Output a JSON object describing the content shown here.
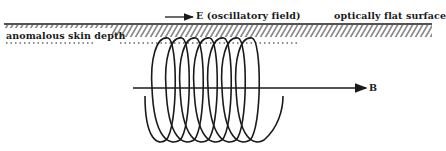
{
  "diagram": {
    "labels": {
      "e_field": "E (oscillatory field)",
      "surface": "optically flat surface",
      "skin_depth": "anomalous skin depth",
      "b_field": "B"
    },
    "elements": {
      "surface_line": {
        "y": 24,
        "x_start": 4,
        "x_end": 432
      },
      "hatch_band": {
        "y_top": 25,
        "y_bottom": 37
      },
      "skin_depth_dashes": {
        "y": 43
      },
      "helix": {
        "turns": 7,
        "center_y": 88,
        "x_start": 145,
        "x_end": 283
      },
      "b_axis_arrow": {
        "y": 88,
        "x_start": 133,
        "x_end": 366
      },
      "e_arrow": {
        "y": 17,
        "x_start": 165,
        "x_end": 194
      }
    },
    "colors": {
      "ink": "#1a1a1a",
      "background": "#ffffff"
    }
  }
}
